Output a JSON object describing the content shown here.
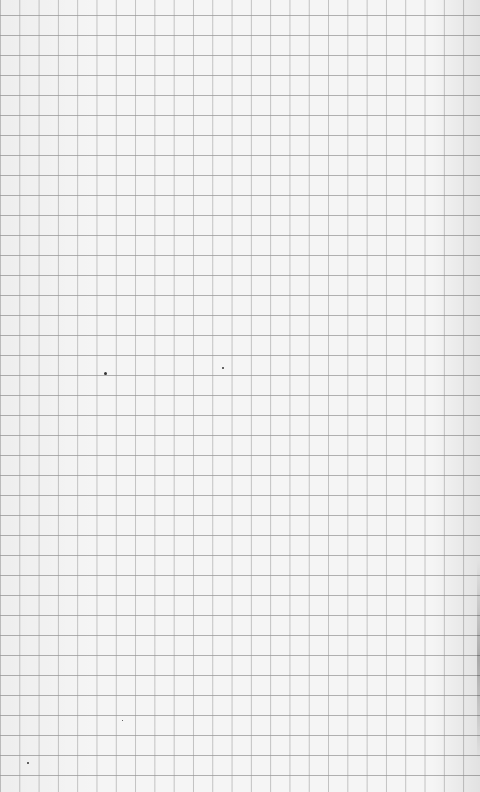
{
  "image": {
    "subject": "graph paper sheet",
    "colors": {
      "paper": "#f5f5f5",
      "grid_line": "#969696",
      "speck": "#333333"
    },
    "specks": [
      {
        "x": 104,
        "y": 372,
        "size": 3
      },
      {
        "x": 222,
        "y": 367,
        "size": 2
      },
      {
        "x": 27,
        "y": 762,
        "size": 2
      },
      {
        "x": 122,
        "y": 720,
        "size": 1
      }
    ]
  }
}
